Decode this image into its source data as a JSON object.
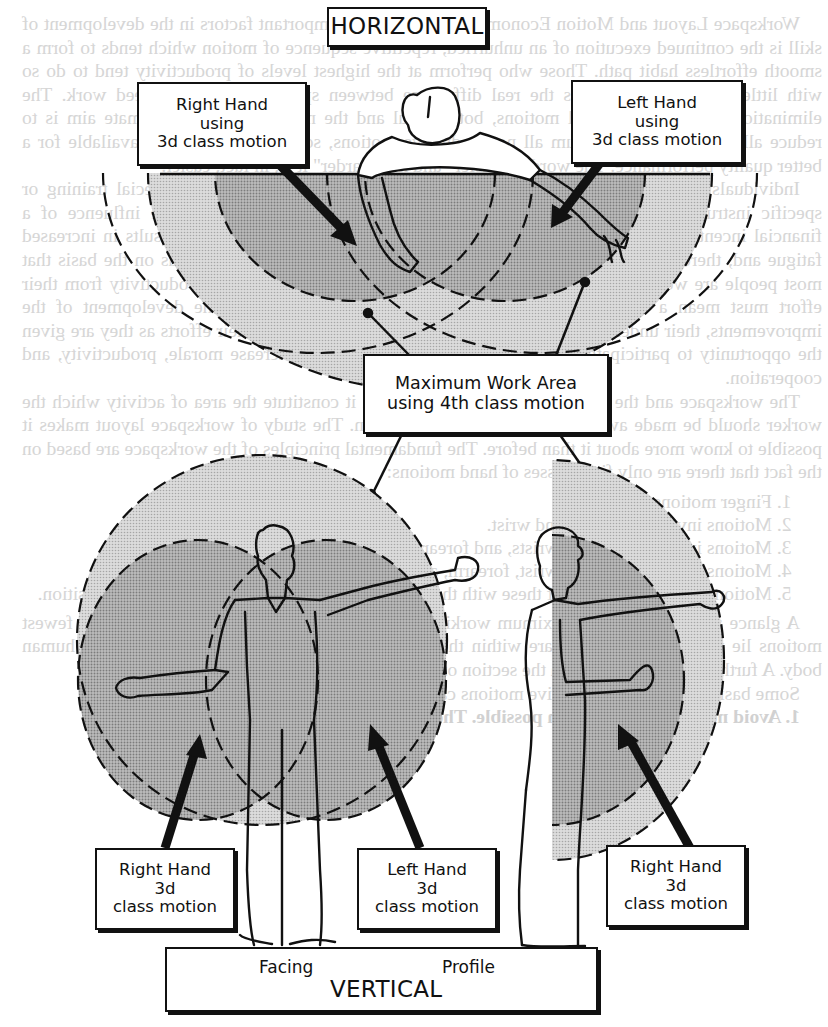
{
  "figure": {
    "horizontal_title": "HORIZONTAL",
    "vertical_title": "VERTICAL",
    "view_facing": "Facing",
    "view_profile": "Profile",
    "labels": {
      "top_right_hand": [
        "Right Hand",
        "using",
        "3d class motion"
      ],
      "top_left_hand": [
        "Left Hand",
        "using",
        "3d class motion"
      ],
      "max_work_area": [
        "Maximum Work Area",
        "using 4th class motion"
      ],
      "bottom_right_hand_facing": [
        "Right Hand",
        "3d",
        "class motion"
      ],
      "bottom_left_hand_facing": [
        "Left Hand",
        "3d",
        "class motion"
      ],
      "bottom_right_hand_profile": [
        "Right Hand",
        "3d",
        "class motion"
      ]
    },
    "colors": {
      "ink": "#111111",
      "light_screen": "#d2d2d2",
      "dark_screen": "#b4b4b4",
      "bleed_text": "#d4d4d4"
    }
  },
  "bleed_through": {
    "paragraphs": [
      "Workspace Layout and Motion Economy. One of the most important factors in the development of skill is the continued execution of an unhurried, repetitive sequence of motion which tends to form a smooth effortless habit path. Those who perform at the highest levels of productivity tend to do so with little or no effort. This is the real difference between speed-up and high-speed work. The elimination or narrowing of all motions, both useful and the nonessential. The ultimate aim is to reduce all motions to a minimum all nonproductive motions, so that all the time is available for a better quality performance. The word is \"easier\" and not \"harder\" it is, in fact, easier.",
      "Individuals left to their own devices will select the easiest method without special training or specific instructions. Any such efforts to increase output, particularly under the influence of a financial incentive, will usually result in \"speed-up.\" It is easy to see how this results in increased fatigue and, therefore, lower morale and resentment. Work simplification proceeds on the basis that most people are working at a reasonable level now and that any increase in productivity from their effort must mean a simplification of that effort. Their participation in the development of the improvements, their understanding of the basic principles involved, and their efforts as they are given the opportunity to participate in improvements usually results in increase morale, productivity, and cooperation.",
      "The workspace and the motions which are used within it constitute the area of activity which the worker should be made aware of in making a contribution. The study of workspace layout makes it possible to know more about it than before. The fundamental principles of the workspace are based on the fact that there are only five classes of hand motions:"
    ],
    "list": [
      "Finger motions.",
      "Motions involving fingers and wrist.",
      "Motions involving fingers, wrists, and forearm.",
      "Motions involving fingers, wrist, forearm, and upper arm.",
      "Motions which include all of these with the addition of a body motion or a change of position."
    ],
    "after_list": [
      "A glance at the normal and maximum working areas diagrammed in Fig. 5 shows that the fewest motions lie within circles which are within the limits established by the dimensions of the human body. A further analysis is given in the section on \"Motion and Methods Study.\"",
      "Some basic principles for effective motions can be stated as follows:"
    ],
    "footer_line": "1. Avoid needless motion when possible. The elimination of non-"
  }
}
